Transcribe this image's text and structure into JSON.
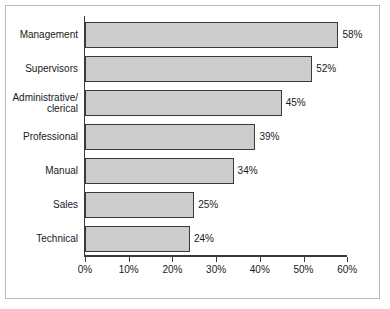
{
  "chart_data": {
    "type": "bar",
    "orientation": "horizontal",
    "title": "",
    "xlabel": "",
    "ylabel": "",
    "xlim": [
      0,
      60
    ],
    "grid": false,
    "legend": null,
    "categories": [
      "Management",
      "Supervisors",
      "Administrative/\nclerical",
      "Professional",
      "Manual",
      "Sales",
      "Technical"
    ],
    "values": [
      58,
      52,
      45,
      39,
      34,
      25,
      24
    ],
    "value_labels": [
      "58%",
      "52%",
      "45%",
      "39%",
      "34%",
      "25%",
      "24%"
    ],
    "xticks": [
      0,
      10,
      20,
      30,
      40,
      50,
      60
    ],
    "xtick_labels": [
      "0%",
      "10%",
      "20%",
      "30%",
      "40%",
      "50%",
      "60%"
    ],
    "colors": {
      "bar_fill": "#cccccc",
      "bar_edge": "#3a3a3a",
      "axis": "#3a3a3a",
      "text": "#1a1a1a",
      "frame": "#b9b9b9",
      "background": "#ffffff"
    }
  }
}
